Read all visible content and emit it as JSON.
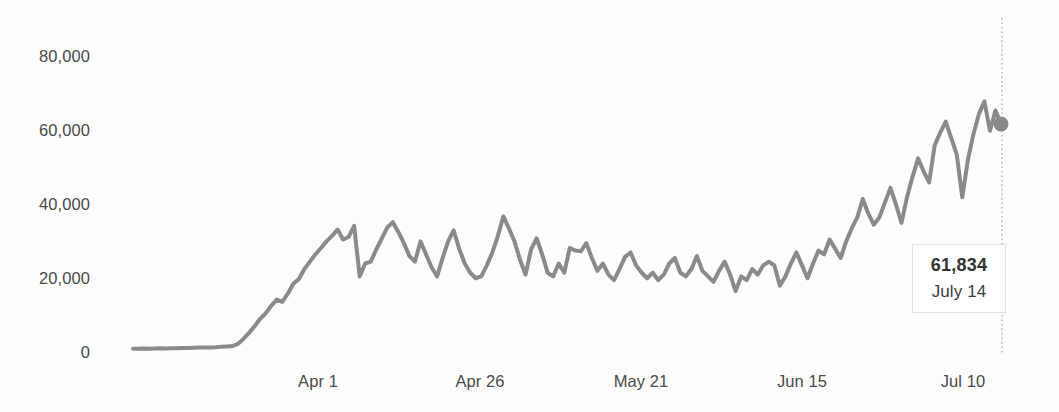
{
  "chart_data": {
    "type": "line",
    "title": "",
    "subtitle": "",
    "xlabel": "",
    "ylabel": "",
    "grid": false,
    "legend": "none",
    "ylim": [
      0,
      85000
    ],
    "y_ticks": [
      "0",
      "20,000",
      "40,000",
      "60,000",
      "80,000"
    ],
    "y_tick_values": [
      0,
      20000,
      40000,
      60000,
      80000
    ],
    "x_ticks": [
      "Apr 1",
      "Apr 26",
      "May 21",
      "Jun 15",
      "Jul 10"
    ],
    "line_color": "#8a8a8a",
    "marker_color": "#8a8a8a",
    "series": [
      {
        "name": "Daily value",
        "values": [
          900,
          900,
          950,
          900,
          950,
          1000,
          950,
          1000,
          1050,
          1100,
          1100,
          1150,
          1200,
          1200,
          1250,
          1300,
          1400,
          1500,
          1600,
          2200,
          3600,
          5200,
          7000,
          9000,
          10500,
          12500,
          14200,
          13600,
          15800,
          18500,
          19800,
          22500,
          24500,
          26500,
          28200,
          30000,
          31500,
          33200,
          30500,
          31200,
          34200,
          20500,
          24000,
          24500,
          27800,
          30800,
          33800,
          35200,
          32500,
          29500,
          26000,
          24500,
          30000,
          26500,
          23000,
          20500,
          25500,
          30000,
          33000,
          28000,
          24000,
          21500,
          20000,
          20500,
          23500,
          27000,
          31500,
          36800,
          33500,
          30000,
          25000,
          21000,
          27800,
          30800,
          26500,
          21500,
          20500,
          24000,
          21500,
          28200,
          27500,
          27300,
          29500,
          25500,
          22000,
          24000,
          21000,
          19500,
          22500,
          25800,
          27000,
          23500,
          21500,
          20000,
          21500,
          19500,
          21000,
          24000,
          25500,
          21500,
          20500,
          22500,
          26000,
          22000,
          20500,
          19000,
          22000,
          24500,
          21000,
          16500,
          20500,
          19500,
          22500,
          21000,
          23500,
          24500,
          23500,
          18000,
          20500,
          24000,
          27000,
          23500,
          20000,
          24000,
          27500,
          26500,
          30500,
          28000,
          25500,
          30000,
          33500,
          36500,
          41500,
          37500,
          34500,
          36500,
          40500,
          44500,
          40000,
          35000,
          42000,
          47500,
          52500,
          49000,
          46000,
          56000,
          59500,
          62500,
          58000,
          53500,
          42000,
          52000,
          59000,
          64500,
          68000,
          60000,
          65500,
          61834
        ]
      }
    ],
    "annotation": {
      "type": "tooltip",
      "value_label": "61,834",
      "date_label": "July 14",
      "value": 61834,
      "marker": true,
      "vertical_line": "dotted"
    }
  },
  "axis": {
    "y_labels": [
      {
        "text": "80,000",
        "y": 47
      },
      {
        "text": "60,000",
        "y": 121
      },
      {
        "text": "40,000",
        "y": 195
      },
      {
        "text": "20,000",
        "y": 269
      },
      {
        "text": "0",
        "y": 343
      }
    ],
    "x_labels": [
      {
        "text": "Apr 1",
        "x": 318
      },
      {
        "text": "Apr 26",
        "x": 480
      },
      {
        "text": "May 21",
        "x": 641
      },
      {
        "text": "Jun 15",
        "x": 802
      },
      {
        "text": "Jul 10",
        "x": 963
      }
    ]
  },
  "tooltip": {
    "value": "61,834",
    "date": "July 14"
  }
}
